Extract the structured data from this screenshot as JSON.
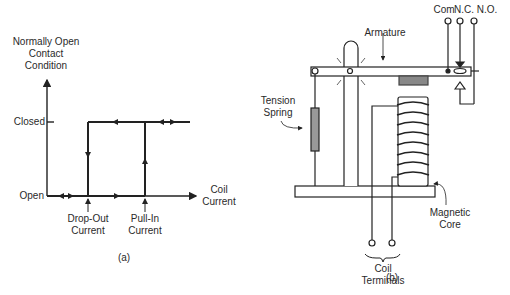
{
  "figure_a": {
    "y_axis_label_line1": "Normally Open",
    "y_axis_label_line2": "Contact",
    "y_axis_label_line3": "Condition",
    "closed_label": "Closed",
    "open_label": "Open",
    "x_axis_label_line1": "Coil",
    "x_axis_label_line2": "Current",
    "dropout_line1": "Drop-Out",
    "dropout_line2": "Current",
    "pullin_line1": "Pull-In",
    "pullin_line2": "Current",
    "caption": "(a)"
  },
  "figure_b": {
    "com_label": "Com",
    "nc_label": "N.C.",
    "no_label": "N.O.",
    "armature_label": "Armature",
    "spring_line1": "Tension",
    "spring_line2": "Spring",
    "core_line1": "Magnetic",
    "core_line2": "Core",
    "coil_term_line1": "Coil",
    "coil_term_line2": "Terminals",
    "caption": "(b)"
  }
}
